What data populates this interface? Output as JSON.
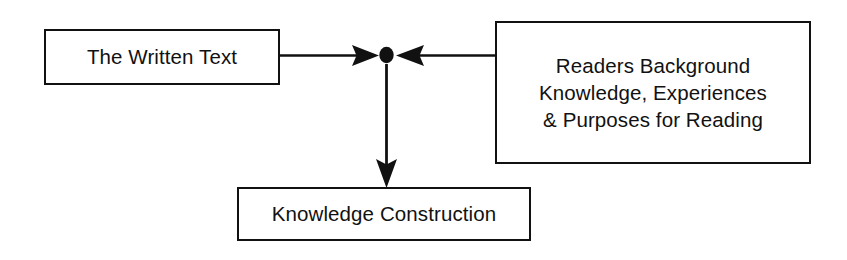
{
  "diagram": {
    "background_color": "#ffffff",
    "stroke_color": "#111111",
    "nodes": [
      {
        "id": "written-text",
        "label": "The Written Text",
        "shape": "rectangle"
      },
      {
        "id": "readers-background",
        "label": "Readers Background\nKnowledge, Experiences\n& Purposes for Reading",
        "shape": "rectangle"
      },
      {
        "id": "knowledge-construction",
        "label": "Knowledge Construction",
        "shape": "rectangle"
      },
      {
        "id": "interaction-point",
        "label": "",
        "shape": "dot"
      }
    ],
    "edges": [
      {
        "id": "written-text-to-interaction",
        "from": "written-text",
        "to": "interaction-point",
        "direction": "right",
        "arrowhead": "solid-triangle"
      },
      {
        "id": "readers-background-to-interaction",
        "from": "readers-background",
        "to": "interaction-point",
        "direction": "left",
        "arrowhead": "solid-triangle"
      },
      {
        "id": "interaction-to-knowledge-construction",
        "from": "interaction-point",
        "to": "knowledge-construction",
        "direction": "down",
        "arrowhead": "solid-triangle"
      }
    ]
  }
}
